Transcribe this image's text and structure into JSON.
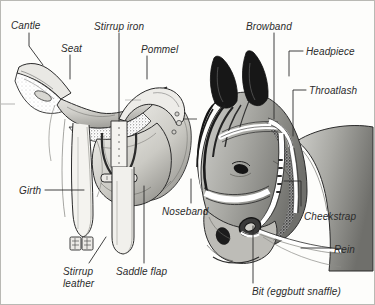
{
  "figure": {
    "kind": "labelled-anatomy-diagram",
    "background_color": "#fdfdfb",
    "ink_color": "#2b2b2b",
    "border_color": "#b9b9b4"
  },
  "labels": [
    {
      "id": "cantle",
      "text": "Cantle",
      "x": 10,
      "y": 19
    },
    {
      "id": "seat",
      "text": "Seat",
      "x": 60,
      "y": 42
    },
    {
      "id": "stirrup-iron",
      "text": "Stirrup iron",
      "x": 93,
      "y": 20
    },
    {
      "id": "pommel",
      "text": "Pommel",
      "x": 140,
      "y": 43
    },
    {
      "id": "girth",
      "text": "Girth",
      "x": 18,
      "y": 184
    },
    {
      "id": "stirrup-leather",
      "text": "Stirrup\nleather",
      "x": 62,
      "y": 265
    },
    {
      "id": "saddle-flap",
      "text": "Saddle flap",
      "x": 115,
      "y": 265
    },
    {
      "id": "browband",
      "text": "Browband",
      "x": 245,
      "y": 20
    },
    {
      "id": "headpiece",
      "text": "Headpiece",
      "x": 305,
      "y": 45
    },
    {
      "id": "throatlash",
      "text": "Throatlash",
      "x": 308,
      "y": 84
    },
    {
      "id": "noseband",
      "text": "Noseband",
      "x": 161,
      "y": 205
    },
    {
      "id": "cheekstrap",
      "text": "Cheekstrap",
      "x": 303,
      "y": 210
    },
    {
      "id": "rein",
      "text": "Rein",
      "x": 333,
      "y": 243
    },
    {
      "id": "bit",
      "text": "Bit (eggbutt snaffle)",
      "x": 251,
      "y": 285
    }
  ],
  "leader_lines": [
    {
      "id": "cantle-leader",
      "points": "28,32 28,45 42,64"
    },
    {
      "id": "seat-leader",
      "points": "69,54 69,78"
    },
    {
      "id": "stirrup-iron-leader",
      "points": "118,32 118,120"
    },
    {
      "id": "pommel-leader",
      "points": "146,55 146,78"
    },
    {
      "id": "girth-leader",
      "points": "44,189 83,189"
    },
    {
      "id": "stirrup-leather-leader",
      "points": "88,262 105,236"
    },
    {
      "id": "saddle-flap-leader",
      "points": "143,262 143,185"
    },
    {
      "id": "browband-leader",
      "points": "273,32 273,118"
    },
    {
      "id": "headpiece-leader",
      "points": "302,50 288,50 288,75"
    },
    {
      "id": "throatlash-leader",
      "points": "305,89 292,89 292,135"
    },
    {
      "id": "noseband-leader",
      "points": "190,202 190,178"
    },
    {
      "id": "cheekstrap-leader",
      "points": "300,205 300,180 283,180"
    },
    {
      "id": "rein-leader",
      "points": "330,247 300,247"
    },
    {
      "id": "bit-leader",
      "points": "252,282 252,225"
    }
  ]
}
